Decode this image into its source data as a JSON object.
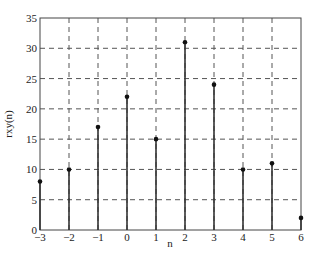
{
  "chart_data": {
    "type": "stem",
    "title": "",
    "xlabel": "n",
    "ylabel": "rxy(n)",
    "x": [
      -3,
      -2,
      -1,
      0,
      1,
      2,
      3,
      4,
      5,
      6
    ],
    "values": [
      8,
      10,
      17,
      22,
      15,
      31,
      24,
      10,
      11,
      2
    ],
    "xlim": [
      -3,
      6
    ],
    "ylim": [
      0,
      35
    ],
    "xticks": [
      "-3",
      "-2",
      "-1",
      "0",
      "1",
      "2",
      "3",
      "4",
      "5",
      "6"
    ],
    "yticks": [
      "0",
      "5",
      "10",
      "15",
      "20",
      "25",
      "30",
      "35"
    ],
    "grid": true,
    "grid_style": "dashed",
    "legend": null,
    "colors": {
      "stem": "#333333",
      "marker": "#111111",
      "grid": "#555555",
      "axes": "#444444"
    }
  }
}
